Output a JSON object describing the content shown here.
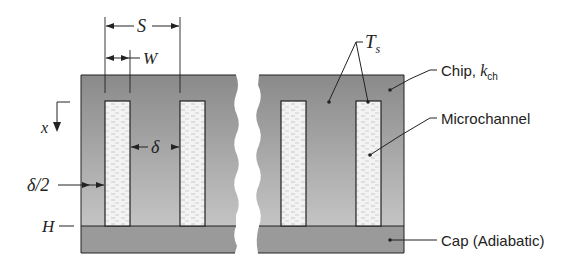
{
  "figure": {
    "colors": {
      "chip": "#8e8e8e",
      "chip_light": "#b8b8b8",
      "cap": "#999999",
      "channel": "#f2f2f2",
      "line": "#222222",
      "background": "#ffffff"
    }
  },
  "dimensions": {
    "S": "S",
    "W": "W",
    "delta": "δ",
    "delta_half": "δ/2",
    "H": "H",
    "x": "x"
  },
  "labels": {
    "Ts_main": "T",
    "Ts_sub": "s",
    "chip_main": "Chip, ",
    "chip_k": "k",
    "chip_sub": "ch",
    "microchannel": "Microchannel",
    "cap": "Cap (Adiabatic)"
  }
}
